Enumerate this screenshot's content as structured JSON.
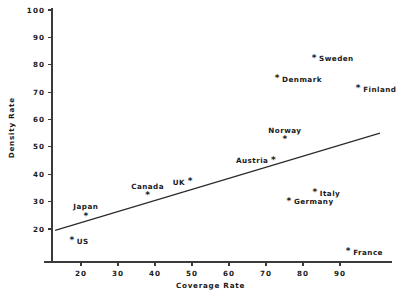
{
  "chart_data": {
    "type": "scatter",
    "title": "",
    "xlabel": "Coverage Rate",
    "ylabel": "Density Rate",
    "xlim": [
      13,
      99
    ],
    "ylim": [
      13,
      100
    ],
    "xticks": [
      20,
      30,
      40,
      50,
      60,
      70,
      80,
      90
    ],
    "yticks": [
      20,
      30,
      40,
      50,
      60,
      70,
      80,
      90,
      100
    ],
    "xtick_labels": [
      "20",
      "30",
      "40",
      "50",
      "60",
      "70",
      "80",
      "90"
    ],
    "ytick_labels": [
      "20",
      "30",
      "40",
      "50",
      "60",
      "70",
      "80",
      "90",
      "100"
    ],
    "grid": false,
    "legend": "none",
    "marker": "asterisk",
    "points": [
      {
        "name": "US",
        "x": 17.5,
        "y": 15.5,
        "label_pos": "right"
      },
      {
        "name": "Japan",
        "x": 21.3,
        "y": 24.5,
        "label_pos": "above"
      },
      {
        "name": "Canada",
        "x": 38.0,
        "y": 32.0,
        "label_pos": "above"
      },
      {
        "name": "UK",
        "x": 49.5,
        "y": 37.0,
        "label_pos": "left"
      },
      {
        "name": "Austria",
        "x": 72.0,
        "y": 45.0,
        "label_pos": "left"
      },
      {
        "name": "Norway",
        "x": 75.1,
        "y": 52.5,
        "label_pos": "above"
      },
      {
        "name": "Germany",
        "x": 76.2,
        "y": 30.0,
        "label_pos": "right"
      },
      {
        "name": "Italy",
        "x": 83.2,
        "y": 33.0,
        "label_pos": "right"
      },
      {
        "name": "Denmark",
        "x": 73.0,
        "y": 74.8,
        "label_pos": "right"
      },
      {
        "name": "Sweden",
        "x": 83.0,
        "y": 82.2,
        "label_pos": "right"
      },
      {
        "name": "Finland",
        "x": 94.9,
        "y": 71.0,
        "label_pos": "right"
      },
      {
        "name": "France",
        "x": 92.2,
        "y": 11.5,
        "label_pos": "right"
      }
    ],
    "fit_line": {
      "description": "regression line",
      "x_start": 13.0,
      "y_start": 19.5,
      "x_end": 100.8,
      "y_end": 55.0
    }
  }
}
